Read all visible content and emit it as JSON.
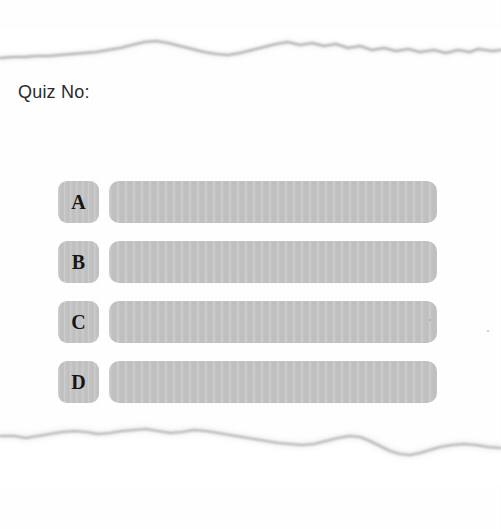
{
  "page": {
    "title": "Quiz No:",
    "background_color": "#ffffff",
    "paper_color": "#fefefe"
  },
  "header": {
    "label": "Quiz No:",
    "value": "",
    "text_color": "#2b2b2b"
  },
  "answers": {
    "fill_color": "#c3c3c3",
    "letter_color": "#161616",
    "options": [
      {
        "letter": "A",
        "text": "",
        "top": 181
      },
      {
        "letter": "B",
        "text": "",
        "top": 241
      },
      {
        "letter": "C",
        "text": "",
        "top": 301
      },
      {
        "letter": "D",
        "text": "",
        "top": 361
      }
    ]
  },
  "torn_edges": {
    "top_label": "torn-paper-edge-top",
    "bottom_label": "torn-paper-edge-bottom",
    "edge_color": "#9a9a9a"
  },
  "specks": [
    {
      "x": 320,
      "y": 18,
      "size": 2
    },
    {
      "x": 378,
      "y": 29,
      "size": 2
    }
  ]
}
